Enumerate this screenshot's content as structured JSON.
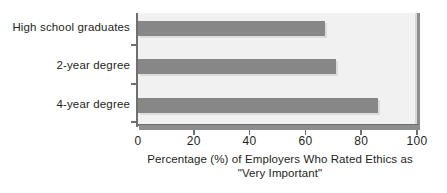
{
  "chart_data": {
    "type": "bar",
    "orientation": "horizontal",
    "title": "",
    "categories": [
      "High school graduates",
      "2-year degree",
      "4-year degree"
    ],
    "values": [
      67,
      71,
      86
    ],
    "xlabel_line1": "Percentage (%) of Employers Who Rated Ethics as",
    "xlabel_line2": "\"Very Important\"",
    "ylabel": "",
    "xlim": [
      0,
      100
    ],
    "xticks": [
      0,
      20,
      40,
      60,
      80,
      100
    ],
    "xtick_labels": [
      "0",
      "20",
      "40",
      "60",
      "80",
      "100"
    ],
    "grid": false,
    "legend": false,
    "legend_position": "none",
    "bar_color": "#878787",
    "plot_background": "#f1f1f1",
    "axis_color": "#6f6f6f",
    "axis_shadow_color": "#8d8d8d",
    "text_color": "#231f20"
  }
}
